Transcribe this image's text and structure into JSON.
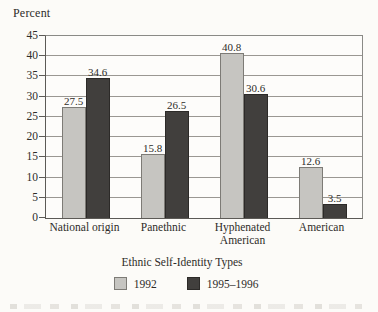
{
  "figure": {
    "kind": "scanned-book-bar-chart"
  },
  "chart_data": {
    "type": "bar",
    "title": "",
    "ylabel": "Percent",
    "xlabel": "Ethnic Self-Identity Types",
    "categories": [
      "National origin",
      "Panethnic",
      "Hyphenated American",
      "American"
    ],
    "series": [
      {
        "name": "1992",
        "color": "#c6c5c1",
        "border": "#7d7b76",
        "values": [
          27.5,
          15.8,
          40.8,
          12.6
        ]
      },
      {
        "name": "1995–1996",
        "color": "#413f3d",
        "border": "#2c2a28",
        "values": [
          34.6,
          26.5,
          30.6,
          3.5
        ]
      }
    ],
    "ylim": [
      0,
      45
    ],
    "ytick_step": 5,
    "grid": true,
    "legend_position": "bottom",
    "value_labels": true
  },
  "colors": {
    "background": "#fcfbf8",
    "gridline": "#9a9792",
    "axis": "#5c5a56",
    "text": "#2e2c29"
  }
}
